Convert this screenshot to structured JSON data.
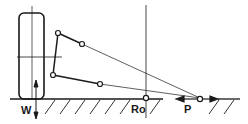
{
  "diagram": {
    "type": "suspension-geometry",
    "labels": {
      "wheel_load": "W",
      "roll_center": "Ro",
      "instant_center": "P"
    },
    "colors": {
      "line": "#1a1a1a",
      "background": "#ffffff"
    }
  }
}
